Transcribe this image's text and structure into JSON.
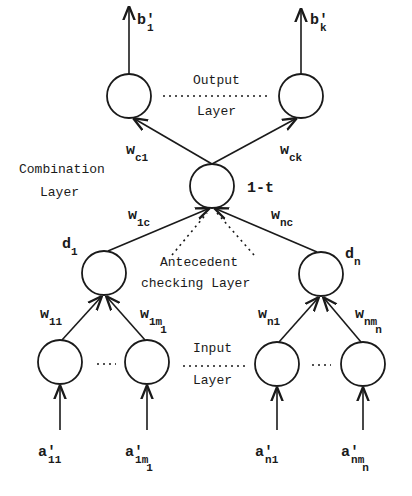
{
  "diagram": {
    "layers": {
      "output": {
        "line1": "Output",
        "line2": "Layer"
      },
      "combination": {
        "line1": "Combination",
        "line2": "Layer"
      },
      "antecedent": {
        "line1": "Antecedent",
        "line2": "checking Layer"
      },
      "input": {
        "line1": "Input",
        "line2": "Layer"
      }
    },
    "nodes": {
      "output_1": {
        "label": "b",
        "prime": "′",
        "sub": "1"
      },
      "output_k": {
        "label": "b",
        "prime": "′",
        "sub": "k"
      },
      "combination": {
        "label": "1-t"
      },
      "antecedent_1": {
        "label": "d",
        "sub": "1"
      },
      "antecedent_n": {
        "label": "d",
        "sub": "n"
      },
      "input_11": {
        "label": "a",
        "prime": "′",
        "sub": "11"
      },
      "input_1m1": {
        "label": "a",
        "prime": "′",
        "sub": "1m",
        "subsub": "1"
      },
      "input_n1": {
        "label": "a",
        "prime": "′",
        "sub": "n1"
      },
      "input_nmn": {
        "label": "a",
        "prime": "′",
        "sub": "nm",
        "subsub": "n"
      }
    },
    "weights": {
      "w_c1": {
        "label": "w",
        "sub": "c1"
      },
      "w_ck": {
        "label": "w",
        "sub": "ck"
      },
      "w_1c": {
        "label": "w",
        "sub": "1c"
      },
      "w_nc": {
        "label": "w",
        "sub": "nc"
      },
      "w_11": {
        "label": "w",
        "sub": "11"
      },
      "w_1m1": {
        "label": "w",
        "sub": "1m",
        "subsub": "1"
      },
      "w_n1": {
        "label": "w",
        "sub": "n1"
      },
      "w_nmn": {
        "label": "w",
        "sub": "nm",
        "subsub": "n"
      }
    },
    "ellipsis": "..."
  }
}
